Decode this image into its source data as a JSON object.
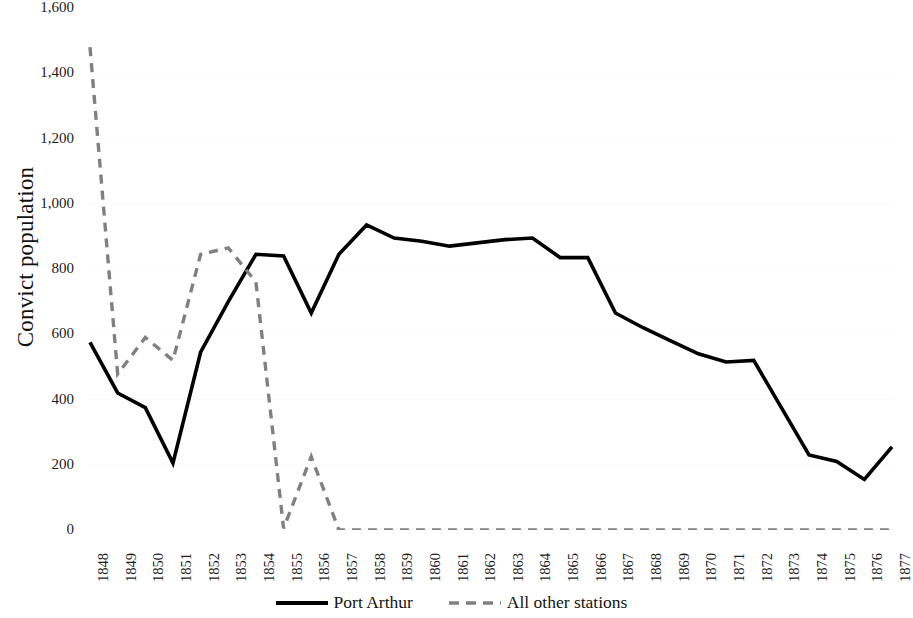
{
  "chart_data": {
    "type": "line",
    "title": "",
    "xlabel": "",
    "ylabel": "Convict population",
    "ylim": [
      0,
      1600
    ],
    "ytick_step": 200,
    "grid": true,
    "grid_axis": "y",
    "legend_position": "bottom-center",
    "x": [
      1848,
      1849,
      1850,
      1851,
      1852,
      1853,
      1854,
      1855,
      1856,
      1857,
      1858,
      1859,
      1860,
      1861,
      1862,
      1863,
      1864,
      1865,
      1866,
      1867,
      1868,
      1869,
      1870,
      1871,
      1872,
      1873,
      1874,
      1875,
      1876,
      1877
    ],
    "categories": [
      "1848",
      "1849",
      "1850",
      "1851",
      "1852",
      "1853",
      "1854",
      "1855",
      "1856",
      "1857",
      "1858",
      "1859",
      "1860",
      "1861",
      "1862",
      "1863",
      "1864",
      "1865",
      "1866",
      "1867",
      "1868",
      "1869",
      "1870",
      "1871",
      "1872",
      "1873",
      "1874",
      "1875",
      "1876",
      "1877"
    ],
    "yticks": [
      0,
      200,
      400,
      600,
      800,
      1000,
      1200,
      1400,
      1600
    ],
    "ytick_labels": [
      "0",
      "200",
      "400",
      "600",
      "800",
      "1,000",
      "1,200",
      "1,400",
      "1,600"
    ],
    "series": [
      {
        "name": "Port Arthur",
        "style": "solid",
        "color": "#000000",
        "width": 3.6,
        "values": [
          575,
          420,
          375,
          205,
          545,
          700,
          845,
          840,
          665,
          845,
          935,
          895,
          885,
          870,
          880,
          890,
          895,
          835,
          835,
          665,
          620,
          580,
          540,
          515,
          520,
          375,
          230,
          210,
          155,
          255
        ]
      },
      {
        "name": "All other stations",
        "style": "dashed",
        "color": "#808080",
        "width": 3.4,
        "values": [
          1480,
          478,
          590,
          520,
          845,
          865,
          760,
          5,
          225,
          0,
          0,
          0,
          0,
          0,
          0,
          0,
          0,
          0,
          0,
          0,
          0,
          0,
          0,
          0,
          0,
          0,
          0,
          0,
          0,
          0
        ]
      }
    ]
  },
  "axis": {
    "y_title": "Convict population"
  },
  "legend": {
    "items": [
      {
        "label": "Port Arthur",
        "style": "solid",
        "color": "#000000"
      },
      {
        "label": "All other stations",
        "style": "dashed",
        "color": "#808080"
      }
    ]
  },
  "colors": {
    "background": "#ffffff",
    "grid": "#fbfbfb",
    "text": "#1a1a1a",
    "port_arthur": "#000000",
    "other_stations": "#808080"
  }
}
